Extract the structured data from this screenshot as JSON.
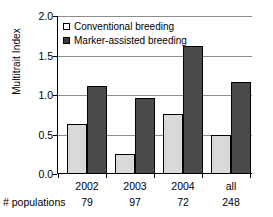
{
  "chart_data": {
    "type": "bar",
    "title": "",
    "xlabel": "",
    "ylabel": "Multitrait Index",
    "categories": [
      "2002",
      "2003",
      "2004",
      "all"
    ],
    "series": [
      {
        "name": "Conventional breeding",
        "color": "#d9d9d9",
        "values": [
          0.63,
          0.25,
          0.76,
          0.5
        ]
      },
      {
        "name": "Marker-assisted breeding",
        "color": "#4a4a4a",
        "values": [
          1.11,
          0.96,
          1.62,
          1.17
        ]
      }
    ],
    "ylim": [
      0.0,
      2.0
    ],
    "yticks": [
      "0.0",
      "0.5",
      "1.0",
      "1.5",
      "2.0"
    ],
    "ytick_values": [
      0.0,
      0.5,
      1.0,
      1.5,
      2.0
    ],
    "grid": true,
    "legend_position": "top-left",
    "annotations": {
      "row_label": "# populations",
      "row_values": [
        "79",
        "97",
        "72",
        "248"
      ]
    }
  },
  "legend": {
    "items": [
      {
        "label": "Conventional breeding",
        "marker": "open-square-icon"
      },
      {
        "label": "Marker-assisted breeding",
        "marker": "filled-square-icon"
      }
    ]
  }
}
